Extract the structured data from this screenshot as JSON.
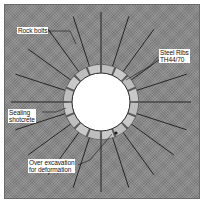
{
  "diagram": {
    "type": "tunnel-support-cross-section",
    "colors": {
      "background": "#8a8a8a",
      "opening": "#ffffff",
      "ring": "#bdbdbd",
      "bolt": "#1a1a1a",
      "label_bg": "#ffffff"
    },
    "labels": {
      "rock_bolts": "Rock bolts",
      "steel_ribs_line1": "Steel Ribs",
      "steel_ribs_line2": "TH44/70",
      "sealing_line1": "Sealing",
      "sealing_line2": "shotcrete",
      "over_excavation_line1": "Over excavation",
      "over_excavation_line2": "for deformation"
    },
    "geometry": {
      "center": [
        101,
        102
      ],
      "opening_radius": 29,
      "ring_outer_radius": 38,
      "ring_segments": 16,
      "bolt_count": 20,
      "bolt_length": 90
    }
  }
}
